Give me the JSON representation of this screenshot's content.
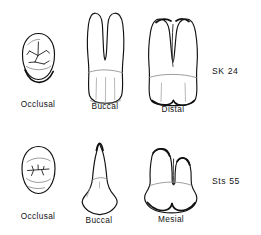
{
  "figure": {
    "type": "scientific-line-drawing",
    "background_color": "#ffffff",
    "ink_color": "#111111",
    "rows": [
      {
        "specimen_label": "SK 24",
        "views": [
          {
            "caption": "Occlusal",
            "shape": "oval crown outline with branching occlusal fissure pattern"
          },
          {
            "caption": "Buccal",
            "shape": "two divergent roots with deep V bifurcation above a bulbous crown"
          },
          {
            "caption": "Distal",
            "shape": "two broad parallel roots above a wide crown with cusp notch"
          }
        ]
      },
      {
        "specimen_label": "Sts 55",
        "views": [
          {
            "caption": "Occlusal",
            "shape": "oval crown outline with transverse wavy fissure pattern"
          },
          {
            "caption": "Buccal",
            "shape": "single tapered root with pointed apex above a wide crown"
          },
          {
            "caption": "Mesial",
            "shape": "two adjacent root lobes above a broad crown with central notch"
          }
        ]
      }
    ]
  },
  "captions": {
    "row1": {
      "occlusal": "Occlusal",
      "buccal": "Buccal",
      "distal": "Distal",
      "specimen": "SK 24"
    },
    "row2": {
      "occlusal": "Occlusal",
      "buccal": "Buccal",
      "mesial": "Mesial",
      "specimen": "Sts 55"
    }
  }
}
